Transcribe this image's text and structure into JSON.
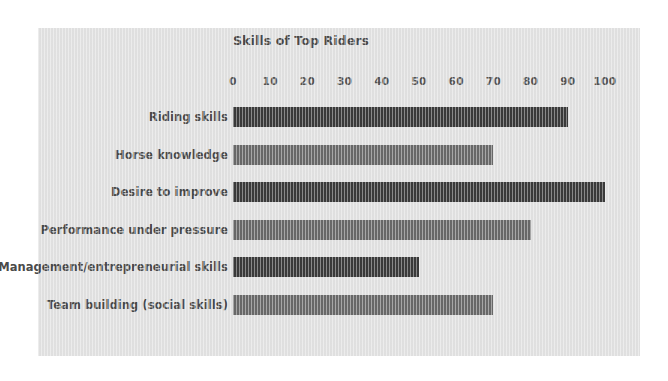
{
  "chart_data": {
    "type": "bar",
    "orientation": "horizontal",
    "title": "Skills of Top Riders",
    "xlabel": "",
    "ylabel": "",
    "xlim": [
      0,
      100
    ],
    "grid": false,
    "legend": false,
    "tick_labels": [
      "0",
      "10",
      "20",
      "30",
      "40",
      "50",
      "60",
      "70",
      "80",
      "90",
      "100"
    ],
    "tick_values": [
      0,
      10,
      20,
      30,
      40,
      50,
      60,
      70,
      80,
      90,
      100
    ],
    "categories": [
      "Riding skills",
      "Horse knowledge",
      "Desire to improve",
      "Performance under pressure",
      "Management/entrepreneurial skills",
      "Team building (social skills)"
    ],
    "values": [
      90,
      70,
      100,
      80,
      50,
      70
    ],
    "bar_colors": [
      "#3d3d3d",
      "#6e6e6e",
      "#3d3d3d",
      "#6e6e6e",
      "#3d3d3d",
      "#6e6e6e"
    ]
  },
  "style": {
    "page_background": "#ffffff",
    "panel_background": "#e2e2e2",
    "text_color": "#4a4a4a",
    "tick_color": "#555555",
    "bar_dark": "#3d3d3d",
    "bar_medium": "#6e6e6e"
  }
}
